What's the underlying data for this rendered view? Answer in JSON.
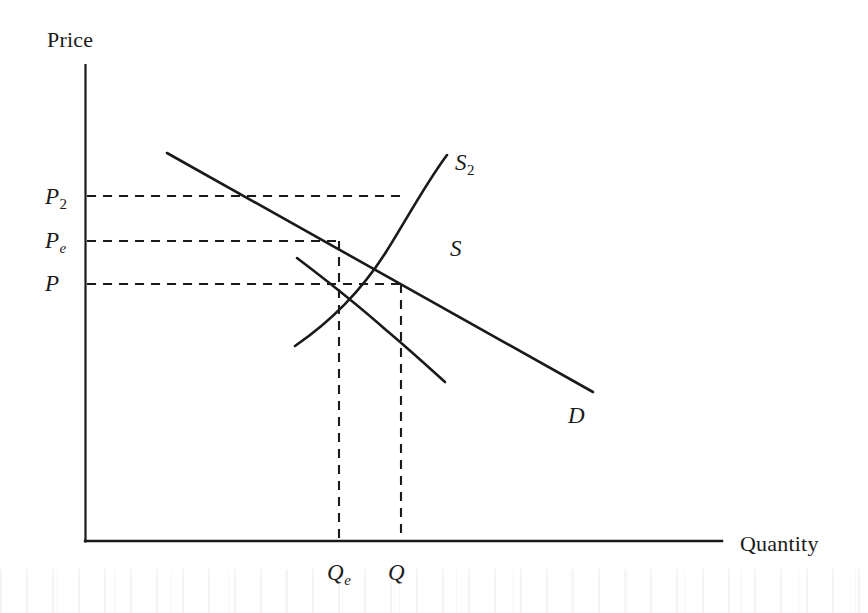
{
  "figure": {
    "type": "economics-supply-demand-diagram",
    "background_color": "#ffffff",
    "line_color": "#1a1a1a"
  },
  "axes": {
    "y_axis_title": "Price",
    "x_axis_title": "Quantity",
    "origin_px": [
      85,
      541
    ],
    "y_axis_top_px": [
      85,
      65
    ],
    "x_axis_right_px": [
      722,
      541
    ]
  },
  "y_ticks": [
    {
      "label": "P",
      "subscript": "2",
      "value_px_y": 196
    },
    {
      "label": "P",
      "subscript": "e",
      "value_px_y": 241
    },
    {
      "label": "P",
      "subscript": "",
      "value_px_y": 284
    }
  ],
  "x_ticks": [
    {
      "label": "Q",
      "subscript": "e",
      "value_px_x": 339
    },
    {
      "label": "Q",
      "subscript": "",
      "value_px_x": 401
    }
  ],
  "curves": [
    {
      "name": "S2",
      "label": "S",
      "subscript": "2",
      "kind": "supply-shifted-left",
      "description": "Upward sloping convex supply curve after shift",
      "path": "M 295,346 C 330,322 362,290 386,252 C 404,224 424,186 447,155"
    },
    {
      "name": "S",
      "label": "S",
      "subscript": "",
      "kind": "supply-original",
      "description": "Upward sloping convex original supply curve",
      "path": "M 297,258 C 330,283 360,307 386,330 C 404,345 424,363 445,382"
    },
    {
      "name": "D",
      "label": "D",
      "subscript": "",
      "kind": "demand",
      "description": "Downward sloping straight demand line",
      "path": "M 167,153 L 593,392"
    }
  ],
  "equilibria": [
    {
      "name": "new-equilibrium",
      "price_label": "Pe",
      "quantity_label": "Qe",
      "point_px": [
        339,
        241
      ]
    },
    {
      "name": "original-equilibrium",
      "price_label": "P",
      "quantity_label": "Q",
      "point_px": [
        401,
        284
      ]
    }
  ],
  "guide_lines": [
    {
      "name": "p2-guide",
      "orientation": "horizontal",
      "from_px": [
        85,
        196
      ],
      "to_px": [
        401,
        196
      ]
    },
    {
      "name": "pe-guide",
      "orientation": "horizontal",
      "from_px": [
        85,
        241
      ],
      "to_px": [
        339,
        241
      ]
    },
    {
      "name": "p-guide",
      "orientation": "horizontal",
      "from_px": [
        85,
        284
      ],
      "to_px": [
        401,
        284
      ]
    },
    {
      "name": "qe-guide",
      "orientation": "vertical",
      "from_px": [
        339,
        241
      ],
      "to_px": [
        339,
        541
      ]
    },
    {
      "name": "q-guide",
      "orientation": "vertical",
      "from_px": [
        401,
        284
      ],
      "to_px": [
        401,
        541
      ]
    }
  ]
}
